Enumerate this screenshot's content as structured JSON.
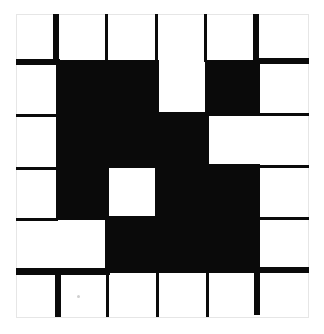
{
  "grid": {
    "rows": 6,
    "cols": 6,
    "colors": {
      "filled": "#0a0a0a",
      "empty": "#ffffff",
      "border": "#e6e6e6"
    },
    "col_edges": [
      16,
      58,
      107,
      157,
      207,
      258,
      309
    ],
    "row_edges": [
      14,
      62,
      114,
      166,
      218,
      271,
      318
    ],
    "cells": [
      [
        0,
        0,
        0,
        0,
        0,
        0
      ],
      [
        0,
        1,
        1,
        0,
        1,
        0
      ],
      [
        0,
        1,
        1,
        1,
        0,
        0
      ],
      [
        0,
        1,
        0,
        1,
        1,
        0
      ],
      [
        0,
        0,
        1,
        1,
        1,
        0
      ],
      [
        0,
        0,
        0,
        0,
        0,
        0
      ]
    ],
    "v_lines": [
      {
        "x": 53,
        "w": 6,
        "y0": 14,
        "y1": 62
      },
      {
        "x": 105,
        "w": 3,
        "y0": 14,
        "y1": 62
      },
      {
        "x": 155,
        "w": 3,
        "y0": 14,
        "y1": 62
      },
      {
        "x": 204,
        "w": 3,
        "y0": 14,
        "y1": 62
      },
      {
        "x": 253,
        "w": 6,
        "y0": 14,
        "y1": 62
      },
      {
        "x": 55,
        "w": 6,
        "y0": 268,
        "y1": 317
      },
      {
        "x": 106,
        "w": 3,
        "y0": 268,
        "y1": 317
      },
      {
        "x": 156,
        "w": 3,
        "y0": 268,
        "y1": 317
      },
      {
        "x": 206,
        "w": 3,
        "y0": 268,
        "y1": 317
      },
      {
        "x": 254,
        "w": 6,
        "y0": 268,
        "y1": 315
      }
    ],
    "h_lines": [
      {
        "y": 59,
        "h": 6,
        "x0": 16,
        "x1": 60
      },
      {
        "y": 58,
        "h": 6,
        "x0": 256,
        "x1": 309
      },
      {
        "y": 114,
        "h": 3,
        "x0": 16,
        "x1": 56
      },
      {
        "y": 113,
        "h": 3,
        "x0": 258,
        "x1": 309
      },
      {
        "y": 167,
        "h": 3,
        "x0": 16,
        "x1": 56
      },
      {
        "y": 165,
        "h": 3,
        "x0": 258,
        "x1": 309
      },
      {
        "y": 218,
        "h": 3,
        "x0": 16,
        "x1": 58
      },
      {
        "y": 217,
        "h": 3,
        "x0": 258,
        "x1": 309
      },
      {
        "y": 268,
        "h": 7,
        "x0": 16,
        "x1": 110
      },
      {
        "y": 267,
        "h": 6,
        "x0": 258,
        "x1": 309
      }
    ]
  }
}
